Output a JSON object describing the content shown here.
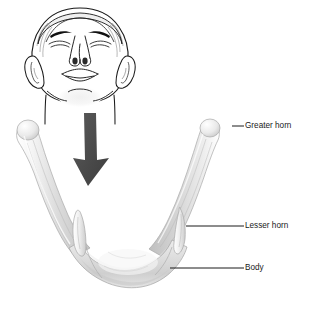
{
  "figure": {
    "background_color": "#ffffff",
    "inset": {
      "name": "head-tilted-back-inferior-view",
      "description": "Line drawing of a human head tilted back, viewed from below, showing the neck region",
      "line_color": "#1a1a1a"
    },
    "arrow": {
      "name": "pointer-arrow",
      "direction": "down",
      "color": "#4a4a4a"
    },
    "bone": {
      "fill_light": "#f2f2f2",
      "fill_mid": "#d8d8d8",
      "fill_dark": "#bdbdbd",
      "outline": "#9a9a9a"
    }
  },
  "labels": [
    {
      "id": "greater-horn",
      "text": "Greater horn",
      "text_x": 245,
      "text_y": 126,
      "leader": {
        "x1": 232,
        "y1": 126,
        "x2": 244,
        "y2": 126
      }
    },
    {
      "id": "lesser-horn",
      "text": "Lesser horn",
      "text_x": 245,
      "text_y": 226,
      "leader": {
        "x1": 186,
        "y1": 226,
        "x2": 244,
        "y2": 226
      }
    },
    {
      "id": "body",
      "text": "Body",
      "text_x": 245,
      "text_y": 268,
      "leader": {
        "x1": 170,
        "y1": 268,
        "x2": 244,
        "y2": 268
      }
    }
  ],
  "anatomy_parts": [
    {
      "id": "greater-horn",
      "name": "Greater horn"
    },
    {
      "id": "lesser-horn",
      "name": "Lesser horn"
    },
    {
      "id": "body",
      "name": "Body"
    }
  ]
}
